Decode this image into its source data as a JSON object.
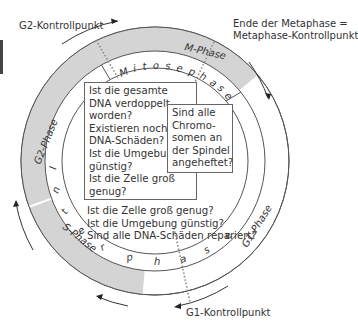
{
  "diagram": {
    "colors": {
      "phase_band_gray": "#d4d4d4",
      "line": "#555555",
      "dotted": "#888888",
      "text": "#333333"
    },
    "phases": {
      "m_phase": "M-Phase",
      "g2_phase": "G2-Phase",
      "s_phase": "S-Phase",
      "g1_phase": "G1-Phase"
    },
    "inner_ring": {
      "mitosephase_letters": [
        "M",
        "i",
        "t",
        "o",
        "s",
        "e",
        "p",
        "h",
        "a",
        "s",
        "e"
      ],
      "interphase_letters": [
        "I",
        "n",
        "t",
        "e",
        "r",
        "p",
        "h",
        "a",
        "s",
        "e"
      ]
    },
    "checkpoints": {
      "g2": "G2-Kontrollpunkt",
      "metaphase_line1": "Ende der Metaphase =",
      "metaphase_line2": "Metaphase-Kontrollpunkt",
      "g1": "G1-Kontrollpunkt"
    },
    "boxes": {
      "g2_questions": [
        "Ist die gesamte",
        "DNA verdoppelt",
        "worden?",
        "Existieren noch",
        "DNA-Schäden?",
        "Ist die Umgebung",
        "günstig?",
        "Ist die Zelle groß",
        "genug?"
      ],
      "metaphase_questions": [
        "Sind alle",
        "Chromo-",
        "somen an",
        "der Spindel",
        "angeheftet?"
      ],
      "g1_questions": [
        "Ist die Zelle groß genug?",
        "Ist die Umgebung günstig?",
        "Sind alle DNA-Schäden repariert?"
      ]
    }
  }
}
